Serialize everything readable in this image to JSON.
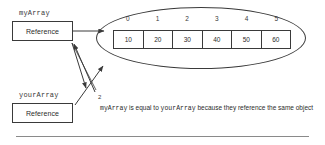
{
  "diagram": {
    "variables": [
      {
        "name": "myArray",
        "box_label": "Reference"
      },
      {
        "name": "yourArray",
        "box_label": "Reference"
      }
    ],
    "array_object": {
      "indices": [
        "0",
        "1",
        "2",
        "3",
        "4",
        "5"
      ],
      "values": [
        "10",
        "20",
        "30",
        "40",
        "50",
        "60"
      ]
    },
    "annotation": {
      "number": "2",
      "caption_part1": "myArray",
      "caption_part2": " is equal to ",
      "caption_part3": "yourArray",
      "caption_part4": "  because they reference the same object"
    },
    "colors": {
      "stroke": "#3a3a3a",
      "text": "#2b2b2b",
      "divider": "#8a8a8a",
      "background": "#ffffff"
    }
  }
}
